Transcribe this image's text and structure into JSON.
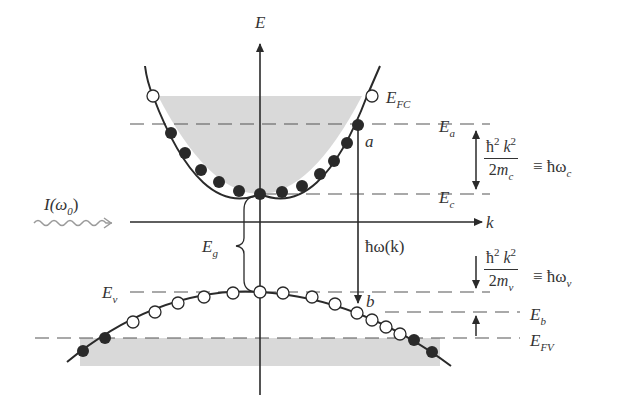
{
  "diagram": {
    "axes": {
      "y_label": "E",
      "x_label": "k"
    },
    "incident_light": {
      "label": "I(ω",
      "label_sub": "0",
      "label_close": ")"
    },
    "bandgap": {
      "label": "E",
      "label_sub": "g"
    },
    "transition": {
      "label": "ħω(k)",
      "start_point": "a",
      "end_point": "b"
    },
    "conduction_band": {
      "fermi_label": "E",
      "fermi_sub": "FC",
      "level_a_label": "E",
      "level_a_sub": "a",
      "edge_label": "E",
      "edge_sub": "c",
      "energy_num": "ħ",
      "energy_num_sup1": "2",
      "energy_num_k": "k",
      "energy_num_sup2": "2",
      "energy_den": "2",
      "energy_den_m": "m",
      "energy_den_sub": "c",
      "equiv": "≡ ħω",
      "equiv_sub": "c"
    },
    "valence_band": {
      "edge_label": "E",
      "edge_sub": "v",
      "level_b_label": "E",
      "level_b_sub": "b",
      "fermi_label": "E",
      "fermi_sub": "FV",
      "energy_num": "ħ",
      "energy_num_sup1": "2",
      "energy_num_k": "k",
      "energy_num_sup2": "2",
      "energy_den": "2",
      "energy_den_m": "m",
      "energy_den_sub": "v",
      "equiv": "≡ ħω",
      "equiv_sub": "v"
    },
    "point_labels": {
      "a": "a",
      "b": "b"
    },
    "colors": {
      "line": "#2a2a2a",
      "fill": "#d9d9d9",
      "dot": "#2a2a2a",
      "wave": "#9a9a9a"
    }
  }
}
